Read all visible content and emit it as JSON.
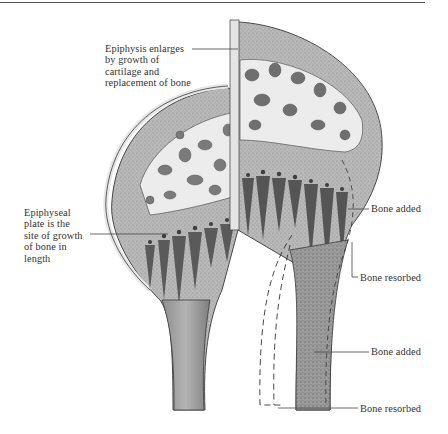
{
  "figure": {
    "labels": {
      "epiphysis": "Epiphysis enlarges\nby growth of\ncartilage and\nreplacement of bone",
      "epiphyseal_plate": "Epiphyseal\nplate is the\nsite of growth\nof bone in\nlength",
      "bone_added_upper": "Bone added",
      "bone_resorbed_upper": "Bone resorbed",
      "bone_added_lower": "Bone added",
      "bone_resorbed_lower": "Bone resorbed"
    },
    "colors": {
      "bone_light": "#d9d9d9",
      "bone_mid": "#a8a8a8",
      "bone_dark": "#6e6e6e",
      "outline": "#3a3a3a",
      "leader_line": "#444444",
      "background": "#ffffff"
    }
  }
}
